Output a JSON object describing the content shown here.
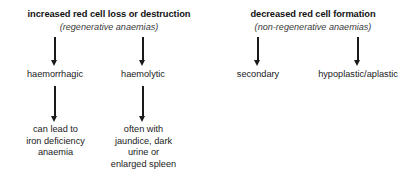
{
  "diagram": {
    "type": "flowchart",
    "orientation": "top-down",
    "background_color": "#ffffff",
    "text_color": "#1a1a1a",
    "branches": [
      {
        "id": "increased-loss",
        "title": "increased red cell loss or destruction",
        "subtitle": "(regenerative anaemias)",
        "children": [
          {
            "id": "haemorrhagic",
            "label": "haemorrhagic",
            "detail": [
              "can lead to",
              "iron deficiency",
              "anaemia"
            ]
          },
          {
            "id": "haemolytic",
            "label": "haemolytic",
            "detail": [
              "often with",
              "jaundice, dark",
              "urine or",
              "enlarged spleen"
            ]
          }
        ]
      },
      {
        "id": "decreased-formation",
        "title": "decreased red cell formation",
        "subtitle": "(non-regenerative anaemias)",
        "children": [
          {
            "id": "secondary",
            "label": "secondary",
            "detail": []
          },
          {
            "id": "hypoplastic",
            "label": "hypoplastic/aplastic",
            "detail": []
          }
        ]
      }
    ],
    "arrows": [
      {
        "id": "arrow-haemorrhagic-in",
        "from": "increased-loss",
        "to": "haemorrhagic",
        "glyph": "down-arrow"
      },
      {
        "id": "arrow-haemolytic-in",
        "from": "increased-loss",
        "to": "haemolytic",
        "glyph": "down-arrow"
      },
      {
        "id": "arrow-secondary-in",
        "from": "decreased-formation",
        "to": "secondary",
        "glyph": "down-arrow"
      },
      {
        "id": "arrow-hypoplastic-in",
        "from": "decreased-formation",
        "to": "hypoplastic",
        "glyph": "down-arrow"
      },
      {
        "id": "arrow-haemorrhagic-out",
        "from": "haemorrhagic",
        "to": "haemorrhagic-detail",
        "glyph": "down-arrow"
      },
      {
        "id": "arrow-haemolytic-out",
        "from": "haemolytic",
        "to": "haemolytic-detail",
        "glyph": "down-arrow"
      }
    ]
  }
}
